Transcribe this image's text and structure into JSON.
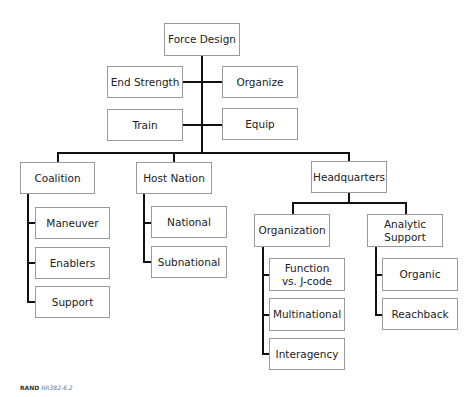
{
  "diagram": {
    "root": "Force Design",
    "root_children": [
      "End Strength",
      "Organize",
      "Train",
      "Equip"
    ],
    "branches": {
      "coalition": {
        "label": "Coalition",
        "children": [
          "Maneuver",
          "Enablers",
          "Support"
        ]
      },
      "host_nation": {
        "label": "Host Nation",
        "children": [
          "National",
          "Subnational"
        ]
      },
      "headquarters": {
        "label": "Headquarters",
        "organization": {
          "label": "Organization",
          "children": [
            "Function vs. J-code",
            "Multinational",
            "Interagency"
          ]
        },
        "analytic_support": {
          "label": "Analytic Support",
          "children": [
            "Organic",
            "Reachback"
          ]
        }
      }
    },
    "line_color": "#111111",
    "box_border_color": "#9a9a9a"
  },
  "credit": {
    "org": "RAND",
    "id": "RR382-6.2"
  }
}
